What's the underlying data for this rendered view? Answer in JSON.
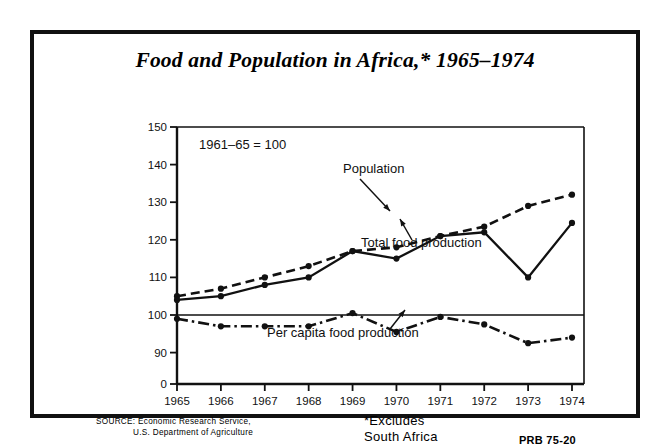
{
  "figure": {
    "title": "Food and Population in Africa,* 1965–1974",
    "index_note": "1961–65 = 100",
    "footnote_line1": "*Excludes",
    "footnote_line2": "South Africa",
    "source_label": "SOURCE:",
    "source_line1": "Economic Research Service,",
    "source_line2": "U.S. Department of Agriculture",
    "publication_code": "PRB 75-20"
  },
  "annotations": [
    {
      "name": "population-label",
      "text": "Population"
    },
    {
      "name": "total-food-label",
      "text": "Total food production"
    },
    {
      "name": "per-capita-label",
      "text": "Per capita food production"
    }
  ],
  "chart_data": {
    "type": "line",
    "title": "Food and Population in Africa,* 1965–1974",
    "subtitle": "1961–65 = 100",
    "xlabel": "",
    "ylabel": "",
    "grid": false,
    "legend_position": "inline-annotations",
    "x": [
      1965,
      1966,
      1967,
      1968,
      1969,
      1970,
      1971,
      1972,
      1973,
      1974
    ],
    "xtick_labels": [
      "1965",
      "1966",
      "1967",
      "1968",
      "1969",
      "1970",
      "1971",
      "1972",
      "1973",
      "1974"
    ],
    "ytick_labels": [
      "0",
      "90",
      "100",
      "110",
      "120",
      "130",
      "140",
      "150"
    ],
    "ytick_values": [
      0,
      90,
      100,
      110,
      120,
      130,
      140,
      150
    ],
    "ylim": [
      90,
      150
    ],
    "axis_break": true,
    "reference_line": 100,
    "series": [
      {
        "name": "Population",
        "style": "dashed",
        "values": [
          105,
          107,
          110,
          113,
          117,
          118,
          121,
          123.5,
          129,
          132
        ]
      },
      {
        "name": "Total food production",
        "style": "solid",
        "values": [
          104,
          105,
          108,
          110,
          117,
          115,
          121,
          122,
          110,
          124.5
        ]
      },
      {
        "name": "Per capita food production",
        "style": "dash-dot",
        "values": [
          99,
          97,
          97,
          97,
          100.5,
          95.5,
          99.5,
          97.5,
          92.5,
          94
        ]
      }
    ]
  }
}
